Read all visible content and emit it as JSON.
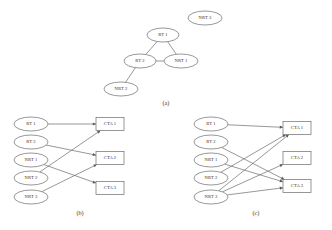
{
  "figure": {
    "background_color": "#ffffff",
    "stroke_color": "#6b6b6b",
    "text_color": "#2f2f2f",
    "panels": [
      {
        "id": "a",
        "caption": "(a)",
        "type": "network-topology",
        "nodes": [
          {
            "id": "rt1",
            "label": "RT 1",
            "x": 163,
            "y": 35,
            "rx": 16,
            "ry": 7
          },
          {
            "id": "rt2",
            "label": "RT 2",
            "x": 140,
            "y": 61,
            "rx": 16,
            "ry": 7
          },
          {
            "id": "nrt1",
            "label": "NRT 1",
            "x": 181,
            "y": 61,
            "rx": 17,
            "ry": 7
          },
          {
            "id": "nrt2",
            "label": "NRT 2",
            "x": 121,
            "y": 89,
            "rx": 17,
            "ry": 7
          },
          {
            "id": "nrt3",
            "label": "NRT 3",
            "x": 205,
            "y": 18,
            "rx": 17,
            "ry": 7
          }
        ],
        "edges": [
          {
            "from": "rt1",
            "to": "rt2"
          },
          {
            "from": "rt1",
            "to": "nrt1"
          },
          {
            "from": "rt2",
            "to": "nrt1"
          },
          {
            "from": "rt2",
            "to": "nrt2"
          }
        ]
      },
      {
        "id": "b",
        "caption": "(b)",
        "type": "bipartite-mapping",
        "sources": [
          {
            "id": "b_rt1",
            "label": "RT 1",
            "x": 31,
            "y": 124,
            "rx": 17,
            "ry": 7
          },
          {
            "id": "b_rt2",
            "label": "RT 2",
            "x": 31,
            "y": 142,
            "rx": 17,
            "ry": 7
          },
          {
            "id": "b_nrt1",
            "label": "NRT 1",
            "x": 31,
            "y": 160,
            "rx": 17,
            "ry": 7
          },
          {
            "id": "b_nrt2",
            "label": "NRT 2",
            "x": 31,
            "y": 178,
            "rx": 17,
            "ry": 7
          },
          {
            "id": "b_nrt3",
            "label": "NRT 3",
            "x": 31,
            "y": 197,
            "rx": 17,
            "ry": 7
          }
        ],
        "targets": [
          {
            "id": "b_cta1",
            "label": "CTA 1",
            "x": 110,
            "y": 124,
            "w": 28,
            "h": 13
          },
          {
            "id": "b_cta2",
            "label": "CTA 2",
            "x": 110,
            "y": 158,
            "w": 28,
            "h": 13
          },
          {
            "id": "b_cta3",
            "label": "CTA 3",
            "x": 110,
            "y": 188,
            "w": 28,
            "h": 13
          }
        ],
        "edges": [
          {
            "from": "b_rt1",
            "to": "b_cta1"
          },
          {
            "from": "b_rt2",
            "to": "b_cta2"
          },
          {
            "from": "b_nrt1",
            "to": "b_cta3"
          },
          {
            "from": "b_nrt2",
            "to": "b_cta1"
          },
          {
            "from": "b_nrt3",
            "to": "b_cta2"
          }
        ]
      },
      {
        "id": "c",
        "caption": "(c)",
        "type": "bipartite-mapping",
        "sources": [
          {
            "id": "c_rt1",
            "label": "RT 1",
            "x": 211,
            "y": 124,
            "rx": 17,
            "ry": 7
          },
          {
            "id": "c_rt2",
            "label": "RT 2",
            "x": 211,
            "y": 142,
            "rx": 17,
            "ry": 7
          },
          {
            "id": "c_nrt1",
            "label": "NRT 1",
            "x": 211,
            "y": 160,
            "rx": 17,
            "ry": 7
          },
          {
            "id": "c_nrt2",
            "label": "NRT 2",
            "x": 211,
            "y": 178,
            "rx": 17,
            "ry": 7
          },
          {
            "id": "c_nrt3",
            "label": "NRT 3",
            "x": 211,
            "y": 197,
            "rx": 17,
            "ry": 7
          }
        ],
        "targets": [
          {
            "id": "c_cta1",
            "label": "CTA 1",
            "x": 297,
            "y": 128,
            "w": 28,
            "h": 13
          },
          {
            "id": "c_cta2",
            "label": "CTA 2",
            "x": 297,
            "y": 158,
            "w": 28,
            "h": 13
          },
          {
            "id": "c_cta3",
            "label": "CTA 3",
            "x": 297,
            "y": 186,
            "w": 28,
            "h": 13
          }
        ],
        "edges": [
          {
            "from": "c_rt1",
            "to": "c_cta1"
          },
          {
            "from": "c_rt2",
            "to": "c_cta3"
          },
          {
            "from": "c_nrt1",
            "to": "c_cta3"
          },
          {
            "from": "c_nrt2",
            "to": "c_cta1"
          },
          {
            "from": "c_nrt3",
            "to": "c_cta1"
          },
          {
            "from": "c_nrt3",
            "to": "c_cta2"
          },
          {
            "from": "c_nrt3",
            "to": "c_cta3"
          }
        ]
      }
    ],
    "captions": [
      {
        "id": "cap_a",
        "text": "(a)",
        "x": 166,
        "y": 104
      },
      {
        "id": "cap_b",
        "text": "(b)",
        "x": 80,
        "y": 214
      },
      {
        "id": "cap_c",
        "text": "(c)",
        "x": 256,
        "y": 214
      }
    ]
  }
}
